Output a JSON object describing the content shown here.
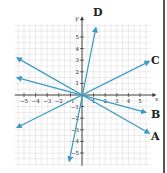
{
  "chart_data": {
    "type": "line",
    "title": "",
    "xlabel": "x",
    "ylabel": "y",
    "xlim": [
      -5.8,
      5.9
    ],
    "ylim": [
      -6.1,
      6.1
    ],
    "grid": true,
    "x_ticks": [
      -5,
      -4,
      -3,
      -2,
      -1,
      1,
      2,
      3,
      4,
      5
    ],
    "y_ticks": [
      -5,
      -4,
      -3,
      -2,
      -1,
      1,
      2,
      3,
      4,
      5
    ],
    "x_tick_labels": [
      "-5",
      "-4",
      "-3",
      "-2",
      "-1",
      "1",
      "2",
      "3",
      "4",
      "5"
    ],
    "y_tick_labels": [
      "-5",
      "-4",
      "-3",
      "-2",
      "-1",
      "1",
      "2",
      "3",
      "4",
      "5"
    ],
    "series": [
      {
        "name": "A",
        "slope": -0.57,
        "x": [
          -5.6,
          5.8
        ],
        "y": [
          3.2,
          -3.3
        ]
      },
      {
        "name": "B",
        "slope": -0.27,
        "x": [
          -5.6,
          5.5
        ],
        "y": [
          1.5,
          -1.5
        ]
      },
      {
        "name": "C",
        "slope": 0.5,
        "x": [
          -5.6,
          5.8
        ],
        "y": [
          -2.8,
          2.9
        ]
      },
      {
        "name": "D",
        "slope": 5.0,
        "x": [
          -1.1,
          1.2
        ],
        "y": [
          -5.7,
          5.8
        ]
      }
    ],
    "line_color": "#3a9bc4",
    "arrows": "both ends"
  },
  "labels": {
    "x_axis": "x",
    "y_axis": "y",
    "A": "A",
    "B": "B",
    "C": "C",
    "D": "D"
  },
  "colors": {
    "line": "#3a9bc4",
    "grid": "#d9d9d9",
    "axis": "#333333",
    "text": "#222222"
  }
}
